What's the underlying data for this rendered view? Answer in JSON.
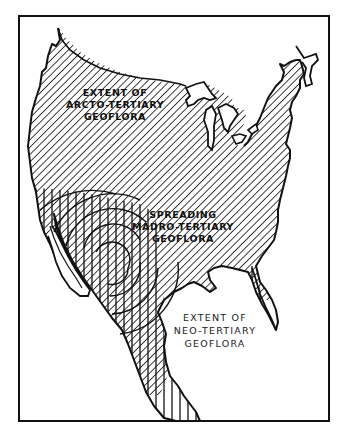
{
  "figure": {
    "type": "hatched geographic map of North America (United States and Mexico)",
    "frame_color": "#111111",
    "background": "#ffffff"
  },
  "labels": {
    "arcto": {
      "line1": "EXTENT OF",
      "line2": "ARCTO-TERTIARY",
      "line3": "GEOFLORA"
    },
    "madro": {
      "line1": "SPREADING",
      "line2": "MADRO-TERTIARY",
      "line3": "GEOFLORA"
    },
    "neo": {
      "line1": "EXTENT OF",
      "line2": "NEO-TERTIARY",
      "line3": "GEOFLORA"
    }
  },
  "legend_patterns": [
    {
      "region": "Arcto-Tertiary Geoflora",
      "pattern": "diagonal hatching"
    },
    {
      "region": "Neo-Tertiary Geoflora",
      "pattern": "vertical hatching"
    },
    {
      "region": "Spreading Madro-Tertiary Geoflora",
      "pattern": "concentric arcs"
    }
  ]
}
